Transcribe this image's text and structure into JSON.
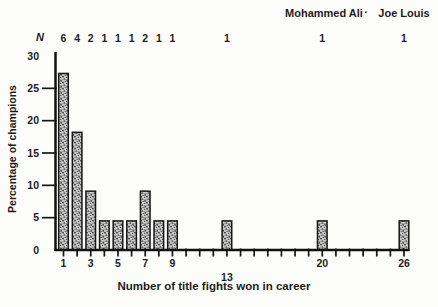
{
  "figure": {
    "top_annotation": {
      "fighter1": "Mohammed Ali",
      "separator": "·",
      "fighter2": "Joe Louis"
    },
    "n_symbol": "N",
    "x_axis_title": "Number of title fights won in career",
    "y_axis_title": "Percentage of champions"
  },
  "chart_data": {
    "type": "bar",
    "title": "",
    "xlabel": "Number of title fights won in career",
    "ylabel": "Percentage of champions",
    "x": [
      1,
      2,
      3,
      4,
      5,
      6,
      7,
      8,
      9,
      13,
      20,
      26
    ],
    "values": [
      27.3,
      18.2,
      9.1,
      4.5,
      4.5,
      4.5,
      9.1,
      4.5,
      4.5,
      4.5,
      4.5,
      4.5
    ],
    "n_counts": [
      6,
      4,
      2,
      1,
      1,
      1,
      2,
      1,
      1,
      1,
      1,
      1
    ],
    "n_total": 22,
    "x_tick_range": [
      1,
      26
    ],
    "x_labeled_ticks": [
      1,
      3,
      5,
      7,
      9,
      13,
      20,
      26
    ],
    "ylim": [
      0,
      30
    ],
    "y_ticks": [
      0,
      5,
      10,
      15,
      20,
      25,
      30
    ],
    "point_annotations": [
      {
        "label": "Mohammed Ali",
        "x": 20
      },
      {
        "label": "Joe Louis",
        "x": 26
      }
    ],
    "grid": false,
    "legend": "none",
    "bar_fill": "speckled-gray",
    "bar_edge_color": "#161616",
    "ink_color": "#1c1c1c",
    "background_color": "#fcfcfa"
  }
}
